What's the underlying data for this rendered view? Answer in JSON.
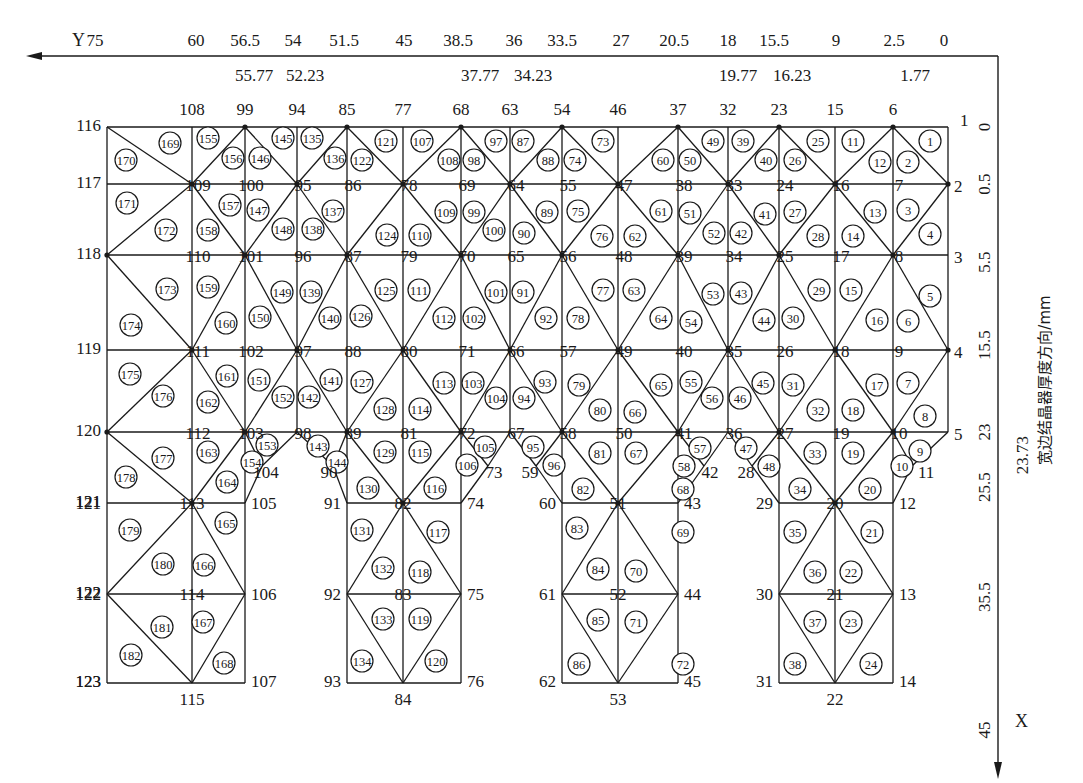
{
  "figure": {
    "type": "finite-element-mesh",
    "x_axis": {
      "name": "X",
      "title": "宽边结晶器厚度方向/mm",
      "ticks": [
        "0",
        "0.5",
        "5.5",
        "15.5",
        "23",
        "23.73",
        "25.5",
        "35.5",
        "45"
      ]
    },
    "y_axis": {
      "name": "Y",
      "ticks_top": [
        "75",
        "60",
        "56.5",
        "54",
        "51.5",
        "45",
        "38.5",
        "36",
        "33.5",
        "27",
        "20.5",
        "18",
        "15.5",
        "9",
        "2.5",
        "0"
      ],
      "ticks_second": [
        "55.77",
        "52.23",
        "37.77",
        "34.23",
        "19.77",
        "16.23",
        "1.77"
      ]
    },
    "nodes": [
      {
        "id": "1",
        "col": 14,
        "row": 0
      },
      {
        "id": "2",
        "col": 14,
        "row": 1
      },
      {
        "id": "3",
        "col": 14,
        "row": 2
      },
      {
        "id": "4",
        "col": 14,
        "row": 3
      },
      {
        "id": "5",
        "col": 14,
        "row": 4
      },
      {
        "id": "6",
        "col": 13,
        "row": 0
      },
      {
        "id": "7",
        "col": 13,
        "row": 1
      },
      {
        "id": "8",
        "col": 13,
        "row": 2
      },
      {
        "id": "9",
        "col": 13,
        "row": 3
      },
      {
        "id": "10",
        "col": 13,
        "row": 4
      },
      {
        "id": "11",
        "notch": "r"
      },
      {
        "id": "12",
        "col": 13,
        "row": 5
      },
      {
        "id": "13",
        "col": 13,
        "row": 6
      },
      {
        "id": "14",
        "col": 13,
        "row": 7
      },
      {
        "id": "15",
        "col": 12,
        "row": 0
      },
      {
        "id": "16",
        "col": 12,
        "row": 1
      },
      {
        "id": "17",
        "col": 12,
        "row": 2
      },
      {
        "id": "18",
        "col": 12,
        "row": 3
      },
      {
        "id": "19",
        "col": 12,
        "row": 4
      },
      {
        "id": "20",
        "col": 12,
        "row": 5
      },
      {
        "id": "21",
        "col": 12,
        "row": 6
      },
      {
        "id": "22",
        "col": 12,
        "row": 7
      },
      {
        "id": "23",
        "col": 11,
        "row": 0
      },
      {
        "id": "24",
        "col": 11,
        "row": 1
      },
      {
        "id": "25",
        "col": 11,
        "row": 2
      },
      {
        "id": "26",
        "col": 11,
        "row": 3
      },
      {
        "id": "27",
        "col": 11,
        "row": 4
      },
      {
        "id": "28",
        "notch": "l"
      },
      {
        "id": "29",
        "col": 11,
        "row": 5
      },
      {
        "id": "30",
        "col": 11,
        "row": 6
      },
      {
        "id": "31",
        "col": 11,
        "row": 7
      },
      {
        "id": "32",
        "col": 10,
        "row": 0
      },
      {
        "id": "33",
        "col": 10,
        "row": 1
      },
      {
        "id": "34",
        "col": 10,
        "row": 2
      },
      {
        "id": "35",
        "col": 10,
        "row": 3
      },
      {
        "id": "36",
        "col": 10,
        "row": 4
      },
      {
        "id": "42",
        "notch": "r"
      },
      {
        "id": "37",
        "col": 9,
        "row": 0
      },
      {
        "id": "38",
        "col": 9,
        "row": 1
      },
      {
        "id": "39",
        "col": 9,
        "row": 2
      },
      {
        "id": "40",
        "col": 9,
        "row": 3
      },
      {
        "id": "41",
        "col": 9,
        "row": 4
      },
      {
        "id": "43",
        "col": 9,
        "row": 5
      },
      {
        "id": "44",
        "col": 9,
        "row": 6
      },
      {
        "id": "45",
        "col": 9,
        "row": 7
      },
      {
        "id": "46",
        "col": 8,
        "row": 0
      },
      {
        "id": "47",
        "col": 8,
        "row": 1
      },
      {
        "id": "48",
        "col": 8,
        "row": 2
      },
      {
        "id": "49",
        "col": 8,
        "row": 3
      },
      {
        "id": "50",
        "col": 8,
        "row": 4
      },
      {
        "id": "51",
        "col": 8,
        "row": 5
      },
      {
        "id": "52",
        "col": 8,
        "row": 6
      },
      {
        "id": "53",
        "col": 8,
        "row": 7
      },
      {
        "id": "54",
        "col": 7,
        "row": 0
      },
      {
        "id": "55",
        "col": 7,
        "row": 1
      },
      {
        "id": "56",
        "col": 7,
        "row": 2
      },
      {
        "id": "57",
        "col": 7,
        "row": 3
      },
      {
        "id": "58",
        "col": 7,
        "row": 4
      },
      {
        "id": "59",
        "notch": "l"
      },
      {
        "id": "60",
        "col": 7,
        "row": 5
      },
      {
        "id": "61",
        "col": 7,
        "row": 6
      },
      {
        "id": "62",
        "col": 7,
        "row": 7
      },
      {
        "id": "63",
        "col": 6,
        "row": 0
      },
      {
        "id": "64",
        "col": 6,
        "row": 1
      },
      {
        "id": "65",
        "col": 6,
        "row": 2
      },
      {
        "id": "66",
        "col": 6,
        "row": 3
      },
      {
        "id": "67",
        "col": 6,
        "row": 4
      },
      {
        "id": "73",
        "notch": "r"
      },
      {
        "id": "68",
        "col": 5,
        "row": 0
      },
      {
        "id": "69",
        "col": 5,
        "row": 1
      },
      {
        "id": "70",
        "col": 5,
        "row": 2
      },
      {
        "id": "71",
        "col": 5,
        "row": 3
      },
      {
        "id": "72",
        "col": 5,
        "row": 4
      },
      {
        "id": "74",
        "col": 5,
        "row": 5
      },
      {
        "id": "75",
        "col": 5,
        "row": 6
      },
      {
        "id": "76",
        "col": 5,
        "row": 7
      },
      {
        "id": "77",
        "col": 4,
        "row": 0
      },
      {
        "id": "78",
        "col": 4,
        "row": 1
      },
      {
        "id": "79",
        "col": 4,
        "row": 2
      },
      {
        "id": "80",
        "col": 4,
        "row": 3
      },
      {
        "id": "81",
        "col": 4,
        "row": 4
      },
      {
        "id": "82",
        "col": 4,
        "row": 5
      },
      {
        "id": "83",
        "col": 4,
        "row": 6
      },
      {
        "id": "84",
        "col": 4,
        "row": 7
      },
      {
        "id": "85",
        "col": 3,
        "row": 0
      },
      {
        "id": "86",
        "col": 3,
        "row": 1
      },
      {
        "id": "87",
        "col": 3,
        "row": 2
      },
      {
        "id": "88",
        "col": 3,
        "row": 3
      },
      {
        "id": "89",
        "col": 3,
        "row": 4
      },
      {
        "id": "90",
        "notch": "l"
      },
      {
        "id": "91",
        "col": 3,
        "row": 5
      },
      {
        "id": "92",
        "col": 3,
        "row": 6
      },
      {
        "id": "93",
        "col": 3,
        "row": 7
      },
      {
        "id": "94",
        "col": 2,
        "row": 0
      },
      {
        "id": "95",
        "col": 2,
        "row": 1
      },
      {
        "id": "96",
        "col": 2,
        "row": 2
      },
      {
        "id": "97",
        "col": 2,
        "row": 3
      },
      {
        "id": "98",
        "col": 2,
        "row": 4
      },
      {
        "id": "104",
        "notch": "r"
      },
      {
        "id": "99",
        "col": 1,
        "row": 0
      },
      {
        "id": "100",
        "col": 1,
        "row": 1
      },
      {
        "id": "101",
        "col": 1,
        "row": 2
      },
      {
        "id": "102",
        "col": 1,
        "row": 3
      },
      {
        "id": "103",
        "col": 1,
        "row": 4
      },
      {
        "id": "105",
        "col": 1,
        "row": 5
      },
      {
        "id": "106",
        "col": 1,
        "row": 6
      },
      {
        "id": "107",
        "col": 1,
        "row": 7
      },
      {
        "id": "108",
        "col": 0,
        "row": 0
      },
      {
        "id": "109",
        "col": 0,
        "row": 1
      },
      {
        "id": "110",
        "col": 0,
        "row": 2
      },
      {
        "id": "111",
        "col": 0,
        "row": 3
      },
      {
        "id": "112",
        "col": 0,
        "row": 4
      },
      {
        "id": "113",
        "col": 0,
        "row": 5
      },
      {
        "id": "114",
        "col": 0,
        "row": 6
      },
      {
        "id": "115",
        "col": 0,
        "row": 7
      },
      {
        "id": "116",
        "col": -1,
        "row": 0
      },
      {
        "id": "117",
        "col": -1,
        "row": 1
      },
      {
        "id": "118",
        "col": -1,
        "row": 2
      },
      {
        "id": "119",
        "col": -1,
        "row": 3
      },
      {
        "id": "120",
        "col": -1,
        "row": 4
      },
      {
        "id": "121",
        "col": -1,
        "row": 5
      },
      {
        "id": "122",
        "col": -1,
        "row": 6
      },
      {
        "id": "123",
        "col": -1,
        "row": 7
      }
    ],
    "element_count": 182,
    "elements": [
      "1",
      "2",
      "3",
      "4",
      "5",
      "6",
      "7",
      "8",
      "9",
      "10",
      "11",
      "12",
      "13",
      "14",
      "15",
      "16",
      "17",
      "18",
      "19",
      "20",
      "21",
      "22",
      "23",
      "24",
      "25",
      "26",
      "27",
      "28",
      "29",
      "30",
      "31",
      "32",
      "33",
      "34",
      "35",
      "36",
      "37",
      "38",
      "39",
      "40",
      "41",
      "42",
      "43",
      "44",
      "45",
      "46",
      "47",
      "48",
      "49",
      "50",
      "51",
      "52",
      "53",
      "54",
      "55",
      "56",
      "57",
      "58",
      "59",
      "60",
      "61",
      "62",
      "63",
      "64",
      "65",
      "66",
      "67",
      "68",
      "69",
      "70",
      "71",
      "72",
      "73",
      "74",
      "75",
      "76",
      "77",
      "78",
      "79",
      "80",
      "81",
      "82",
      "83",
      "84",
      "85",
      "86",
      "87",
      "88",
      "89",
      "90",
      "91",
      "92",
      "93",
      "94",
      "95",
      "96",
      "97",
      "98",
      "99",
      "100",
      "101",
      "102",
      "103",
      "104",
      "105",
      "106",
      "107",
      "108",
      "109",
      "110",
      "111",
      "112",
      "113",
      "114",
      "115",
      "116",
      "117",
      "118",
      "119",
      "120",
      "121",
      "122",
      "123",
      "124",
      "125",
      "126",
      "127",
      "128",
      "129",
      "130",
      "131",
      "132",
      "133",
      "134",
      "135",
      "136",
      "137",
      "138",
      "139",
      "140",
      "141",
      "142",
      "143",
      "144",
      "145",
      "146",
      "147",
      "148",
      "149",
      "150",
      "151",
      "152",
      "153",
      "154",
      "155",
      "156",
      "157",
      "158",
      "159",
      "160",
      "161",
      "162",
      "163",
      "164",
      "165",
      "166",
      "167",
      "168",
      "169",
      "170",
      "171",
      "172",
      "173",
      "174",
      "175",
      "176",
      "177",
      "178",
      "179",
      "180",
      "181",
      "182"
    ]
  }
}
